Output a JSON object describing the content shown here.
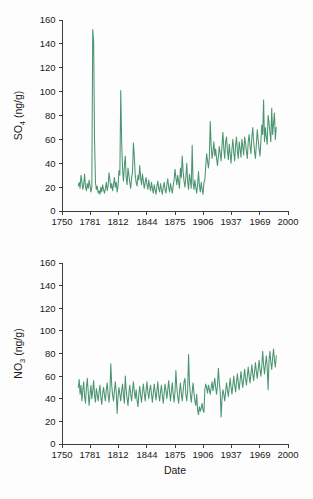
{
  "figure": {
    "background": "#fdfdfd",
    "accent": "#4a9470",
    "axis_color": "#3d3d3d"
  },
  "chart_data": [
    {
      "id": "so4",
      "type": "line",
      "title": "",
      "xlabel": "",
      "ylabel": "SO4 (ng/g)",
      "ylabel_base": "SO",
      "ylabel_sub": "4",
      "ylabel_unit": " (ng/g)",
      "series_name": "SO4 concentration",
      "color": "#4a9470",
      "xlim": [
        1750,
        2000
      ],
      "ylim": [
        0,
        160
      ],
      "xticks": [
        1750,
        1781,
        1812,
        1844,
        1875,
        1906,
        1937,
        1969,
        2000
      ],
      "xticklabels": [
        "1750",
        "1781",
        "1812",
        "1844",
        "1875",
        "1906",
        "1937",
        "1969",
        "2000"
      ],
      "yticks": [
        0,
        20,
        40,
        60,
        80,
        100,
        120,
        140,
        160
      ],
      "yticklabels": [
        "0",
        "20",
        "40",
        "60",
        "80",
        "100",
        "120",
        "140",
        "160"
      ],
      "grid": false,
      "legend": "none",
      "x": [
        1768,
        1769,
        1770,
        1771,
        1772,
        1773,
        1774,
        1775,
        1776,
        1777,
        1778,
        1779,
        1780,
        1781,
        1782,
        1783,
        1784,
        1785,
        1786,
        1787,
        1788,
        1789,
        1790,
        1791,
        1792,
        1793,
        1794,
        1795,
        1796,
        1797,
        1798,
        1799,
        1800,
        1801,
        1802,
        1803,
        1804,
        1805,
        1806,
        1807,
        1808,
        1809,
        1810,
        1811,
        1812,
        1813,
        1814,
        1815,
        1816,
        1817,
        1818,
        1819,
        1820,
        1821,
        1822,
        1823,
        1824,
        1825,
        1826,
        1827,
        1828,
        1829,
        1830,
        1831,
        1832,
        1833,
        1834,
        1835,
        1836,
        1837,
        1838,
        1839,
        1840,
        1841,
        1842,
        1843,
        1844,
        1845,
        1846,
        1847,
        1848,
        1849,
        1850,
        1851,
        1852,
        1853,
        1854,
        1855,
        1856,
        1857,
        1858,
        1859,
        1860,
        1861,
        1862,
        1863,
        1864,
        1865,
        1866,
        1867,
        1868,
        1869,
        1870,
        1871,
        1872,
        1873,
        1874,
        1875,
        1876,
        1877,
        1878,
        1879,
        1880,
        1881,
        1882,
        1883,
        1884,
        1885,
        1886,
        1887,
        1888,
        1889,
        1890,
        1891,
        1892,
        1893,
        1894,
        1895,
        1896,
        1897,
        1898,
        1899,
        1900,
        1901,
        1902,
        1903,
        1904,
        1905,
        1906,
        1907,
        1908,
        1909,
        1910,
        1911,
        1912,
        1913,
        1914,
        1915,
        1916,
        1917,
        1918,
        1919,
        1920,
        1921,
        1922,
        1923,
        1924,
        1925,
        1926,
        1927,
        1928,
        1929,
        1930,
        1931,
        1932,
        1933,
        1934,
        1935,
        1936,
        1937,
        1938,
        1939,
        1940,
        1941,
        1942,
        1943,
        1944,
        1945,
        1946,
        1947,
        1948,
        1949,
        1950,
        1951,
        1952,
        1953,
        1954,
        1955,
        1956,
        1957,
        1958,
        1959,
        1960,
        1961,
        1962,
        1963,
        1964,
        1965,
        1966,
        1967,
        1968,
        1969,
        1970,
        1971,
        1972,
        1973,
        1974,
        1975,
        1976,
        1977,
        1978,
        1979,
        1980,
        1981,
        1982,
        1983,
        1984,
        1985,
        1986,
        1987
      ],
      "values": [
        21,
        24,
        19,
        30,
        25,
        18,
        22,
        31,
        20,
        17,
        23,
        19,
        26,
        21,
        16,
        20,
        152,
        142,
        60,
        24,
        18,
        21,
        15,
        17,
        14,
        20,
        16,
        22,
        18,
        15,
        19,
        24,
        17,
        21,
        32,
        26,
        19,
        23,
        17,
        22,
        28,
        20,
        24,
        16,
        21,
        34,
        30,
        101,
        58,
        35,
        25,
        38,
        46,
        28,
        22,
        36,
        30,
        24,
        19,
        28,
        33,
        57,
        46,
        30,
        24,
        21,
        30,
        26,
        38,
        28,
        22,
        31,
        25,
        19,
        24,
        28,
        22,
        18,
        26,
        21,
        17,
        24,
        19,
        15,
        22,
        18,
        14,
        21,
        25,
        19,
        16,
        23,
        18,
        14,
        20,
        24,
        18,
        15,
        22,
        27,
        20,
        16,
        23,
        19,
        15,
        21,
        26,
        35,
        28,
        22,
        30,
        24,
        19,
        36,
        28,
        46,
        33,
        25,
        20,
        28,
        40,
        24,
        18,
        31,
        25,
        19,
        55,
        24,
        18,
        26,
        20,
        15,
        22,
        33,
        21,
        16,
        24,
        18,
        14,
        24,
        26,
        37,
        48,
        42,
        36,
        45,
        75,
        55,
        44,
        50,
        58,
        46,
        52,
        44,
        38,
        46,
        54,
        48,
        42,
        55,
        66,
        52,
        44,
        58,
        62,
        50,
        43,
        56,
        48,
        40,
        52,
        60,
        49,
        42,
        55,
        62,
        50,
        44,
        58,
        52,
        45,
        60,
        54,
        47,
        62,
        57,
        50,
        44,
        58,
        64,
        54,
        48,
        62,
        70,
        58,
        50,
        44,
        56,
        68,
        60,
        52,
        46,
        58,
        72,
        64,
        93,
        58,
        70,
        62,
        56,
        80,
        74,
        66,
        58,
        86,
        64,
        74,
        82,
        60,
        70,
        78,
        64,
        58,
        72,
        84,
        70,
        62,
        80,
        92,
        74,
        64,
        78,
        70,
        62,
        74
      ]
    },
    {
      "id": "no3",
      "type": "line",
      "title": "",
      "xlabel": "Date",
      "ylabel": "NO3 (ng/g)",
      "ylabel_base": "NO",
      "ylabel_sub": "3",
      "ylabel_unit": " (ng/g)",
      "series_name": "NO3 concentration",
      "color": "#4a9470",
      "xlim": [
        1750,
        2000
      ],
      "ylim": [
        0,
        160
      ],
      "xticks": [
        1750,
        1781,
        1812,
        1844,
        1875,
        1906,
        1937,
        1969,
        2000
      ],
      "xticklabels": [
        "1750",
        "1781",
        "1812",
        "1844",
        "1875",
        "1906",
        "1937",
        "1969",
        "2000"
      ],
      "yticks": [
        0,
        20,
        40,
        60,
        80,
        100,
        120,
        140,
        160
      ],
      "yticklabels": [
        "0",
        "20",
        "40",
        "60",
        "80",
        "100",
        "120",
        "140",
        "160"
      ],
      "grid": false,
      "legend": "none",
      "x": [
        1768,
        1769,
        1770,
        1771,
        1772,
        1773,
        1774,
        1775,
        1776,
        1777,
        1778,
        1779,
        1780,
        1781,
        1782,
        1783,
        1784,
        1785,
        1786,
        1787,
        1788,
        1789,
        1790,
        1791,
        1792,
        1793,
        1794,
        1795,
        1796,
        1797,
        1798,
        1799,
        1800,
        1801,
        1802,
        1803,
        1804,
        1805,
        1806,
        1807,
        1808,
        1809,
        1810,
        1811,
        1812,
        1813,
        1814,
        1815,
        1816,
        1817,
        1818,
        1819,
        1820,
        1821,
        1822,
        1823,
        1824,
        1825,
        1826,
        1827,
        1828,
        1829,
        1830,
        1831,
        1832,
        1833,
        1834,
        1835,
        1836,
        1837,
        1838,
        1839,
        1840,
        1841,
        1842,
        1843,
        1844,
        1845,
        1846,
        1847,
        1848,
        1849,
        1850,
        1851,
        1852,
        1853,
        1854,
        1855,
        1856,
        1857,
        1858,
        1859,
        1860,
        1861,
        1862,
        1863,
        1864,
        1865,
        1866,
        1867,
        1868,
        1869,
        1870,
        1871,
        1872,
        1873,
        1874,
        1875,
        1876,
        1877,
        1878,
        1879,
        1880,
        1881,
        1882,
        1883,
        1884,
        1885,
        1886,
        1887,
        1888,
        1889,
        1890,
        1891,
        1892,
        1893,
        1894,
        1895,
        1896,
        1897,
        1898,
        1899,
        1900,
        1901,
        1902,
        1903,
        1904,
        1905,
        1906,
        1907,
        1908,
        1909,
        1910,
        1911,
        1912,
        1913,
        1914,
        1915,
        1916,
        1917,
        1918,
        1919,
        1920,
        1921,
        1922,
        1923,
        1924,
        1925,
        1926,
        1927,
        1928,
        1929,
        1930,
        1931,
        1932,
        1933,
        1934,
        1935,
        1936,
        1937,
        1938,
        1939,
        1940,
        1941,
        1942,
        1943,
        1944,
        1945,
        1946,
        1947,
        1948,
        1949,
        1950,
        1951,
        1952,
        1953,
        1954,
        1955,
        1956,
        1957,
        1958,
        1959,
        1960,
        1961,
        1962,
        1963,
        1964,
        1965,
        1966,
        1967,
        1968,
        1969,
        1970,
        1971,
        1972,
        1973,
        1974,
        1975,
        1976,
        1977,
        1978,
        1979,
        1980,
        1981,
        1982,
        1983,
        1984,
        1985,
        1986,
        1987
      ],
      "values": [
        50,
        57,
        44,
        52,
        38,
        48,
        55,
        42,
        36,
        50,
        58,
        46,
        34,
        44,
        52,
        40,
        47,
        56,
        43,
        37,
        49,
        44,
        38,
        46,
        52,
        41,
        35,
        45,
        50,
        43,
        38,
        48,
        54,
        44,
        37,
        46,
        71,
        52,
        43,
        38,
        47,
        55,
        46,
        27,
        42,
        50,
        44,
        38,
        47,
        53,
        43,
        36,
        60,
        48,
        40,
        34,
        45,
        52,
        44,
        38,
        47,
        55,
        46,
        40,
        48,
        39,
        33,
        44,
        51,
        43,
        37,
        46,
        53,
        45,
        38,
        47,
        55,
        46,
        40,
        48,
        52,
        44,
        37,
        45,
        53,
        46,
        39,
        47,
        55,
        44,
        38,
        46,
        52,
        43,
        36,
        45,
        53,
        47,
        40,
        48,
        56,
        46,
        38,
        47,
        54,
        44,
        37,
        46,
        65,
        50,
        42,
        36,
        46,
        54,
        45,
        38,
        47,
        55,
        58,
        44,
        38,
        47,
        79,
        54,
        44,
        37,
        46,
        54,
        45,
        38,
        34,
        44,
        30,
        26,
        33,
        29,
        32,
        36,
        30,
        28,
        48,
        53,
        50,
        45,
        52,
        48,
        44,
        50,
        55,
        47,
        52,
        58,
        50,
        44,
        52,
        67,
        54,
        46,
        24,
        40,
        48,
        44,
        38,
        46,
        54,
        48,
        42,
        50,
        58,
        50,
        44,
        52,
        60,
        52,
        46,
        54,
        62,
        54,
        48,
        56,
        64,
        56,
        50,
        58,
        66,
        58,
        52,
        60,
        68,
        60,
        54,
        62,
        70,
        62,
        56,
        64,
        72,
        64,
        58,
        66,
        74,
        66,
        60,
        68,
        82,
        70,
        62,
        70,
        78,
        68,
        48,
        74,
        82,
        72,
        66,
        76,
        84,
        74,
        68,
        78,
        86,
        78,
        70,
        80,
        90,
        143,
        104,
        94,
        110,
        90,
        102,
        112
      ]
    }
  ]
}
